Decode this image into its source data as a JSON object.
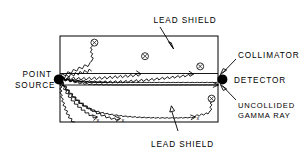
{
  "figure": {
    "labels": {
      "lead_shield_top": "LEAD SHIELD",
      "lead_shield_bottom": "LEAD SHIELD",
      "point_source_line1": "POINT",
      "point_source_line2": "SOURCE",
      "collimator": "COLLIMATOR",
      "detector": "DETECTOR",
      "uncollided_line1": "UNCOLLIDED",
      "uncollided_line2": "GAMMA RAY"
    },
    "marker_glyph": "x",
    "colors": {
      "ink": "#000000",
      "background": "#ffffff"
    },
    "geometry": {
      "shield_rect": {
        "x": 60,
        "y": 36,
        "width": 158,
        "height": 86
      },
      "source_point": {
        "x": 59,
        "y": 79
      },
      "detector_point": {
        "x": 222,
        "y": 79
      },
      "collimator_channel": {
        "x1": 60,
        "y1": 73,
        "x2": 218,
        "y2": 85
      }
    },
    "rays": [
      {
        "id": "ray-scattered-upper-1",
        "endpoint": [
          96,
          42
        ],
        "terminator": "circled-x"
      },
      {
        "id": "ray-scattered-upper-2",
        "endpoint": [
          143,
          56
        ],
        "terminator": "circled-x"
      },
      {
        "id": "ray-scattered-upper-3",
        "endpoint": [
          199,
          66
        ],
        "terminator": "circled-x"
      },
      {
        "id": "ray-uncollided-beam",
        "endpoint": [
          220,
          79
        ],
        "terminator": "detector"
      },
      {
        "id": "ray-scattered-lower-1",
        "endpoint": [
          100,
          122
        ],
        "terminator": "x"
      },
      {
        "id": "ray-scattered-lower-2",
        "endpoint": [
          122,
          116
        ],
        "terminator": "x"
      },
      {
        "id": "ray-scattered-lower-3",
        "endpoint": [
          195,
          117
        ],
        "terminator": "x"
      },
      {
        "id": "ray-scattered-lower-4",
        "endpoint": [
          210,
          98
        ],
        "terminator": "circled-x"
      }
    ]
  }
}
